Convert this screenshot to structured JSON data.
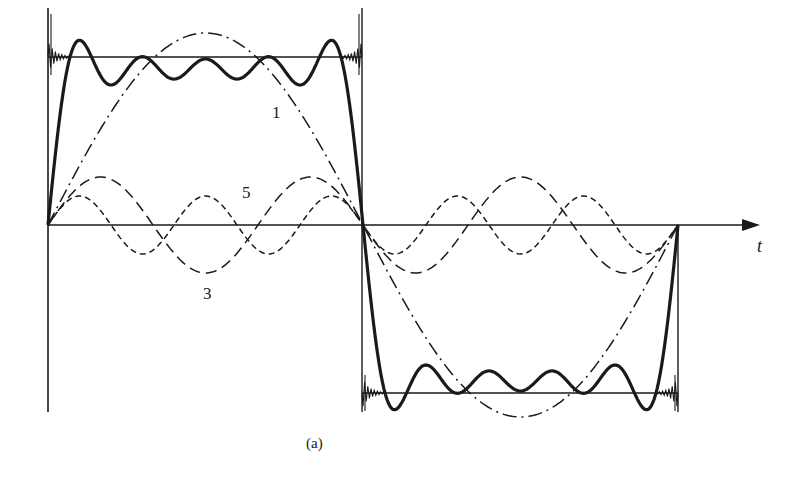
{
  "figure": {
    "caption": "(a)",
    "axis_label": "t",
    "curve_labels": {
      "fundamental": "1",
      "third_harmonic": "3",
      "fifth_harmonic": "5"
    },
    "colors": {
      "ink": "#1a1a1a",
      "background": "#ffffff"
    }
  },
  "diagram": {
    "type": "fourier-series-square-wave",
    "geometry": {
      "x_start": 48,
      "x_mid": 362,
      "x_end": 678,
      "axis_y": 225,
      "square_high_y": 57,
      "square_low_y": 393,
      "left_edge_top": 8,
      "left_edge_bottom": 412,
      "axis_arrow_x": 757,
      "fundamental_amp": 192,
      "third_amp": 48,
      "fifth_amp": 29
    },
    "elements": [
      {
        "name": "square-wave",
        "style": "thin solid"
      },
      {
        "name": "partial-sum",
        "style": "bold solid"
      },
      {
        "name": "harmonic-1",
        "style": "long dash-dot",
        "label": "1"
      },
      {
        "name": "harmonic-3",
        "style": "long dash",
        "label": "3"
      },
      {
        "name": "harmonic-5",
        "style": "short dash",
        "label": "5"
      },
      {
        "name": "gibbs-ringing",
        "style": "thin oscillation at corners"
      }
    ]
  }
}
